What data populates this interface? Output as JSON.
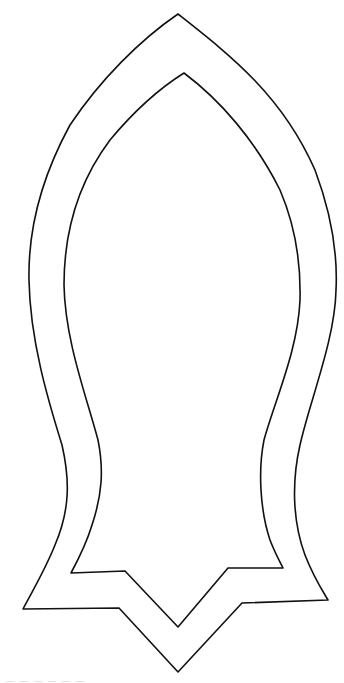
{
  "figure": {
    "background_color": "#ffffff",
    "line_color": "#111111",
    "line_width": 1.6,
    "outer_contour": {
      "label": "outer-outline",
      "path": "M178,14 C230,55 282,95 315,170 C330,210 338,250 336,290 C335,340 310,400 300,445 C292,480 292,520 305,555 C314,578 322,590 328,600 L242,603 L178,672 L119,608 L23,609 C33,590 45,570 55,545 C70,510 70,480 62,445 C48,400 30,340 29,280 C28,230 40,180 70,125 C100,80 140,40 178,14 Z"
    },
    "inner_contour": {
      "label": "inner-outline",
      "path": "M184,73 C220,100 255,140 280,190 C295,225 301,260 300,300 C298,350 275,400 264,440 C258,470 260,510 270,540 C275,553 280,562 283,568 L228,568 L178,627 L125,571 L71,573 C78,560 86,545 92,525 C102,495 104,470 98,440 C86,395 65,340 64,285 C64,230 80,180 110,140 C135,110 160,88 184,73 Z"
    }
  },
  "caption": {
    "text": "— — — — — —",
    "note": "partially cut-off caption text at bottom edge, illegible"
  }
}
